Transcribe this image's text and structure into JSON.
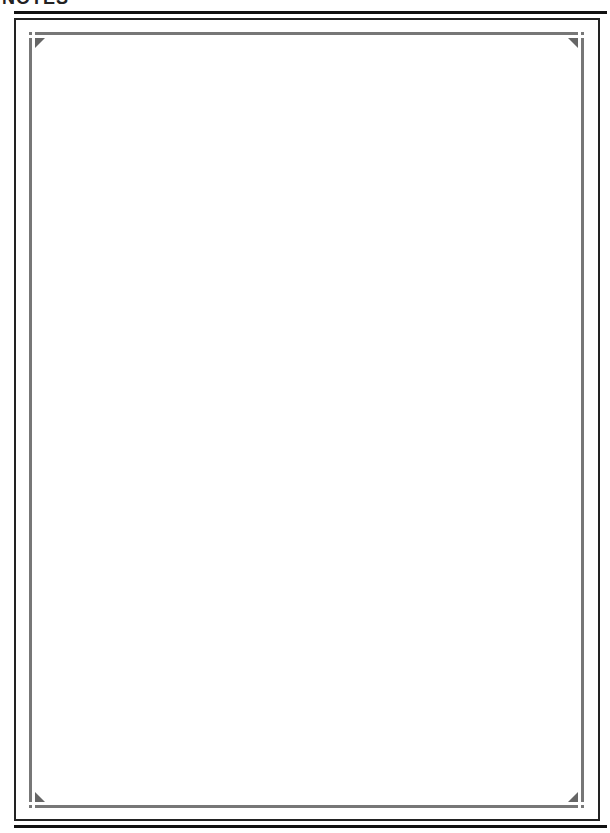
{
  "page": {
    "title": "NOTES",
    "colors": {
      "rule": "#111111",
      "outer_border": "#222222",
      "inner_frame": "#777777",
      "corner_ornament": "#666666",
      "background": "#ffffff"
    }
  },
  "notes_area": {
    "content": ""
  }
}
